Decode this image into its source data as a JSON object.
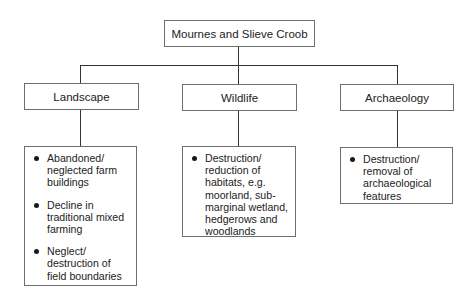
{
  "root": {
    "label": "Mournes and Slieve Croob"
  },
  "categories": [
    {
      "label": "Landscape",
      "items": [
        "Abandoned/ neglected farm buildings",
        "Decline in traditional mixed farming",
        "Neglect/ destruction of field boundaries"
      ]
    },
    {
      "label": "Wildlife",
      "items": [
        "Destruction/ reduction of habitats, e.g. moorland, sub-marginal wetland, hedgerows and woodlands"
      ]
    },
    {
      "label": "Archaeology",
      "items": [
        "Destruction/ removal of archaeological features"
      ]
    }
  ],
  "colors": {
    "border": "#6e6e6e",
    "connector": "#333333",
    "text": "#222222"
  }
}
